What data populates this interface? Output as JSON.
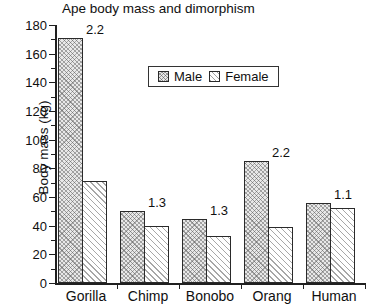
{
  "chart_data": {
    "type": "bar",
    "title": "Ape body mass and dimorphism",
    "xlabel": "",
    "ylabel": "Body mass (kg)",
    "ylim": [
      0,
      180
    ],
    "ytick_step": 20,
    "yticks": [
      0,
      20,
      40,
      60,
      80,
      100,
      120,
      140,
      160,
      180
    ],
    "minor_ticks": true,
    "grid": false,
    "legend_position": "upper center",
    "categories": [
      "Gorilla",
      "Chimp",
      "Bonobo",
      "Orang",
      "Human"
    ],
    "series": [
      {
        "name": "Male",
        "values": [
          171,
          50,
          45,
          85,
          56
        ]
      },
      {
        "name": "Female",
        "values": [
          71,
          40,
          33,
          39,
          52
        ]
      }
    ],
    "annotations": {
      "label": "dimorphism ratio",
      "values": [
        "2.2",
        "1.3",
        "1.3",
        "2.2",
        "1.1"
      ]
    }
  },
  "legend": {
    "entries": [
      {
        "label": "Male",
        "swatch": "hatched-crosshatch-swatch"
      },
      {
        "label": "Female",
        "swatch": "hatched-diagonal-swatch"
      }
    ]
  }
}
